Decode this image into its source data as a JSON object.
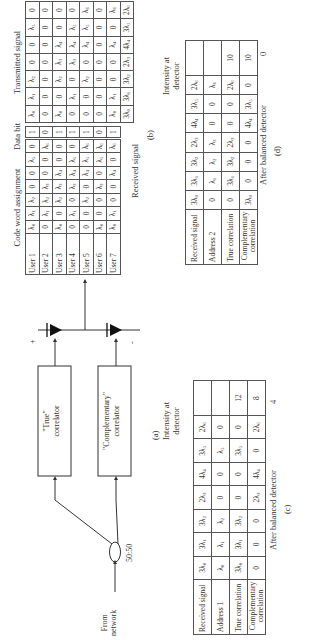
{
  "figure": {
    "panel_a": {
      "label": "(a)",
      "input_label": [
        "From",
        "network"
      ],
      "coupler_label": "50:50",
      "true_correlator": [
        "\"True\"",
        "correlator"
      ],
      "complementary_correlator": [
        "\"Complementary\"",
        "correlator"
      ],
      "plus_sign": "+",
      "minus_sign": "-"
    },
    "panel_b": {
      "label": "(b)",
      "code_word_title": "Code word assignment",
      "data_bit_title": "Data bit",
      "transmitted_title": "Transmitted signal",
      "received_label": "Received signal",
      "users": [
        "User 1",
        "User 2",
        "User 3",
        "User 4",
        "User 5",
        "User 6",
        "User 7"
      ],
      "code_words": [
        [
          "λ0",
          "λ1",
          "λ2",
          "0",
          "0",
          "λ5",
          "0"
        ],
        [
          "0",
          "λ1",
          "λ2",
          "λ3",
          "0",
          "0",
          "λ6"
        ],
        [
          "λ0",
          "0",
          "λ2",
          "λ3",
          "λ4",
          "0",
          "0"
        ],
        [
          "0",
          "λ1",
          "0",
          "λ3",
          "λ4",
          "λ5",
          "0"
        ],
        [
          "0",
          "0",
          "λ2",
          "0",
          "λ4",
          "λ5",
          "λ6"
        ],
        [
          "λ0",
          "0",
          "0",
          "λ3",
          "0",
          "λ5",
          "λ6"
        ],
        [
          "λ0",
          "λ1",
          "0",
          "0",
          "λ4",
          "0",
          "λ6"
        ]
      ],
      "data_bits": [
        "1",
        "0",
        "1",
        "1",
        "1",
        "0",
        "1"
      ],
      "transmitted": [
        [
          "λ0",
          "λ1",
          "λ2",
          "0",
          "0",
          "λ5",
          "0"
        ],
        [
          "0",
          "0",
          "0",
          "0",
          "0",
          "0",
          "0"
        ],
        [
          "λ0",
          "0",
          "λ2",
          "λ3",
          "λ4",
          "0",
          "0"
        ],
        [
          "0",
          "λ1",
          "0",
          "λ3",
          "λ4",
          "λ5",
          "0"
        ],
        [
          "0",
          "0",
          "λ2",
          "0",
          "λ4",
          "λ5",
          "λ6"
        ],
        [
          "0",
          "0",
          "0",
          "0",
          "0",
          "0",
          "0"
        ],
        [
          "λ0",
          "λ1",
          "0",
          "0",
          "λ4",
          "0",
          "λ6"
        ]
      ],
      "received": [
        "3λ0",
        "3λ1",
        "3λ2",
        "2λ3",
        "4λ4",
        "3λ5",
        "2λ6"
      ]
    },
    "panel_c": {
      "label": "(c)",
      "intensity_header": [
        "Intensity at",
        "detector"
      ],
      "rows": [
        {
          "name": "Received signal",
          "cells": [
            "3λ0",
            "3λ1",
            "3λ2",
            "2λ3",
            "4λ4",
            "3λ5",
            "2λ6"
          ],
          "intensity": ""
        },
        {
          "name": "Address 1",
          "cells": [
            "λ0",
            "λ1",
            "λ2",
            "0",
            "0",
            "λ5",
            "0"
          ],
          "intensity": ""
        },
        {
          "name": "True correlation",
          "cells": [
            "3λ0",
            "3λ1",
            "3λ2",
            "0",
            "0",
            "3λ5",
            "0"
          ],
          "intensity": "12"
        },
        {
          "name": "Complementary correlation",
          "cells": [
            "0",
            "0",
            "0",
            "2λ3",
            "4λ4",
            "0",
            "2λ6"
          ],
          "intensity": "8"
        }
      ],
      "after_label": "After balanced detector",
      "after_value": "4"
    },
    "panel_d": {
      "label": "(d)",
      "intensity_header": [
        "Intensity at",
        "detector"
      ],
      "rows": [
        {
          "name": "Received signal",
          "cells": [
            "3λ0",
            "3λ1",
            "3λ2",
            "2λ3",
            "4λ4",
            "3λ5",
            "2λ6"
          ],
          "intensity": ""
        },
        {
          "name": "Address 2",
          "cells": [
            "0",
            "λ1",
            "λ2",
            "λ3",
            "0",
            "0",
            "λ6"
          ],
          "intensity": ""
        },
        {
          "name": "True correlation",
          "cells": [
            "0",
            "3λ1",
            "3λ2",
            "2λ3",
            "0",
            "0",
            "2λ6"
          ],
          "intensity": "10"
        },
        {
          "name": "Complementary correlation",
          "cells": [
            "3λ0",
            "0",
            "0",
            "0",
            "4λ4",
            "3λ5",
            "0"
          ],
          "intensity": "10"
        }
      ],
      "after_label": "After balanced detector",
      "after_value": "0"
    }
  }
}
